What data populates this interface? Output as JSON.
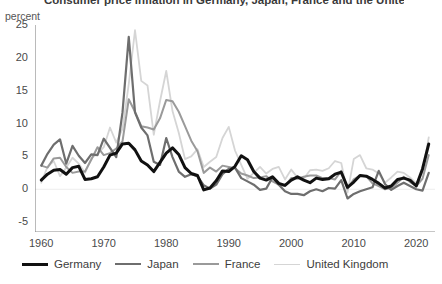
{
  "title": "Consumer price inflation in Germany, Japan, France and the United Kingdom",
  "axis_unit": "percent",
  "legend": {
    "items": [
      {
        "label": "Germany",
        "color": "#111111",
        "width": 3.0
      },
      {
        "label": "Japan",
        "color": "#6e6e6e",
        "width": 2.2
      },
      {
        "label": "France",
        "color": "#9a9a9a",
        "width": 2.0
      },
      {
        "label": "United Kingdom",
        "color": "#d5d5d5",
        "width": 1.8
      }
    ]
  },
  "chart_data": {
    "type": "line",
    "title": "Consumer price inflation in Germany, Japan, France and the United Kingdom",
    "xlabel": "",
    "ylabel": "percent",
    "xlim": [
      1959,
      2023
    ],
    "ylim": [
      -6.5,
      25
    ],
    "yticks": [
      25,
      20,
      15,
      10,
      5,
      0,
      -5
    ],
    "xticks": [
      1960,
      1970,
      1980,
      1990,
      2000,
      2010,
      2020
    ],
    "minor_tick_interval": 2,
    "grid": "zero-line-only",
    "legend_position": "below",
    "x": [
      1960,
      1961,
      1962,
      1963,
      1964,
      1965,
      1966,
      1967,
      1968,
      1969,
      1970,
      1971,
      1972,
      1973,
      1974,
      1975,
      1976,
      1977,
      1978,
      1979,
      1980,
      1981,
      1982,
      1983,
      1984,
      1985,
      1986,
      1987,
      1988,
      1989,
      1990,
      1991,
      1992,
      1993,
      1994,
      1995,
      1996,
      1997,
      1998,
      1999,
      2000,
      2001,
      2002,
      2003,
      2004,
      2005,
      2006,
      2007,
      2008,
      2009,
      2010,
      2011,
      2012,
      2013,
      2014,
      2015,
      2016,
      2017,
      2018,
      2019,
      2020,
      2021,
      2022
    ],
    "series": [
      {
        "name": "Germany",
        "color": "#111111",
        "values": [
          1.4,
          2.3,
          2.9,
          3.0,
          2.3,
          3.3,
          3.5,
          1.5,
          1.6,
          1.9,
          3.4,
          5.2,
          5.5,
          6.9,
          7.0,
          6.0,
          4.3,
          3.7,
          2.7,
          4.1,
          5.5,
          6.3,
          5.3,
          3.3,
          2.4,
          2.1,
          -0.1,
          0.2,
          1.3,
          2.8,
          2.7,
          3.5,
          5.1,
          4.5,
          2.7,
          1.7,
          1.4,
          1.9,
          0.9,
          0.6,
          1.4,
          1.9,
          1.4,
          1.0,
          1.7,
          1.5,
          1.6,
          2.3,
          2.6,
          0.3,
          1.1,
          2.1,
          2.0,
          1.5,
          0.9,
          0.2,
          0.5,
          1.5,
          1.7,
          1.4,
          0.5,
          3.1,
          6.9
        ]
      },
      {
        "name": "Japan",
        "color": "#6e6e6e",
        "values": [
          3.6,
          5.4,
          6.8,
          7.6,
          3.9,
          6.6,
          5.1,
          4.0,
          5.3,
          5.2,
          7.7,
          6.3,
          4.9,
          11.7,
          23.2,
          11.7,
          9.4,
          8.2,
          4.2,
          3.7,
          7.8,
          4.9,
          2.7,
          1.9,
          2.3,
          2.0,
          0.6,
          0.1,
          0.7,
          2.3,
          3.1,
          3.3,
          1.7,
          1.2,
          0.7,
          -0.1,
          0.1,
          1.8,
          0.7,
          -0.3,
          -0.7,
          -0.7,
          -0.9,
          -0.3,
          0.0,
          -0.3,
          0.2,
          0.1,
          1.4,
          -1.4,
          -0.7,
          -0.3,
          0.0,
          0.3,
          2.8,
          0.8,
          -0.1,
          0.5,
          1.0,
          0.5,
          0.0,
          -0.2,
          2.5
        ]
      },
      {
        "name": "France",
        "color": "#9a9a9a",
        "values": [
          3.6,
          3.3,
          4.7,
          4.8,
          3.4,
          2.5,
          2.7,
          2.7,
          4.5,
          6.4,
          5.2,
          5.5,
          6.2,
          7.3,
          13.7,
          11.8,
          9.6,
          9.4,
          9.1,
          10.8,
          13.6,
          13.4,
          11.8,
          9.6,
          7.4,
          5.8,
          2.5,
          3.3,
          2.7,
          3.6,
          3.4,
          3.2,
          2.4,
          2.1,
          1.7,
          1.8,
          2.0,
          1.2,
          0.7,
          0.5,
          1.7,
          1.6,
          1.9,
          2.1,
          2.1,
          1.7,
          1.7,
          1.5,
          2.8,
          0.1,
          1.5,
          2.1,
          2.0,
          0.9,
          0.5,
          0.0,
          0.2,
          1.0,
          1.9,
          1.1,
          0.5,
          1.6,
          5.2
        ]
      },
      {
        "name": "United Kingdom",
        "color": "#d5d5d5",
        "values": [
          1.0,
          3.4,
          4.3,
          2.0,
          3.3,
          4.8,
          3.9,
          2.5,
          4.7,
          5.4,
          6.4,
          9.4,
          7.1,
          9.2,
          16.0,
          24.2,
          16.5,
          15.8,
          8.3,
          13.4,
          18.0,
          11.9,
          8.6,
          4.6,
          5.0,
          6.1,
          3.4,
          4.2,
          4.9,
          7.8,
          9.5,
          5.9,
          3.7,
          1.6,
          2.5,
          3.4,
          2.4,
          3.1,
          3.4,
          1.5,
          3.0,
          1.8,
          1.6,
          2.9,
          3.0,
          2.8,
          3.2,
          4.3,
          4.0,
          -0.5,
          4.6,
          5.2,
          3.2,
          3.0,
          2.4,
          1.0,
          1.8,
          2.7,
          2.5,
          1.8,
          0.9,
          2.6,
          7.9
        ]
      }
    ]
  }
}
